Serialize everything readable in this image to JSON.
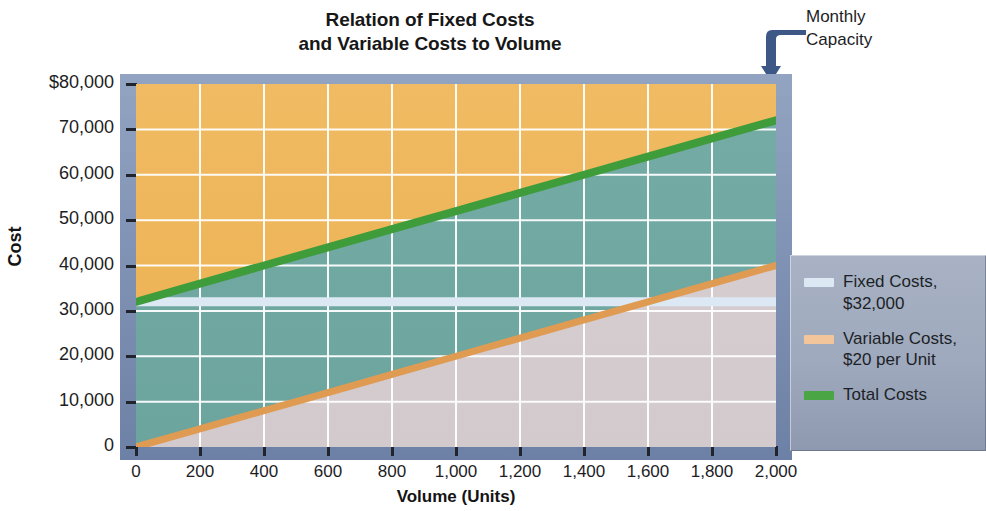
{
  "title": {
    "line1": "Relation of Fixed Costs",
    "line2": "and Variable Costs to Volume"
  },
  "annotation": {
    "name": "monthly-capacity",
    "line1": "Monthly",
    "line2": "Capacity",
    "icon": "elbow-arrow-down-icon",
    "at_volume": 2000
  },
  "axes": {
    "y_title": "Cost",
    "x_title": "Volume (Units)",
    "y_ticks": [
      "$80,000",
      "70,000",
      "60,000",
      "50,000",
      "40,000",
      "30,000",
      "20,000",
      "10,000",
      "0"
    ],
    "y_values": [
      80000,
      70000,
      60000,
      50000,
      40000,
      30000,
      20000,
      10000,
      0
    ],
    "x_ticks": [
      "0",
      "200",
      "400",
      "600",
      "800",
      "1,000",
      "1,200",
      "1,400",
      "1,600",
      "1,800",
      "2,000"
    ],
    "x_values": [
      0,
      200,
      400,
      600,
      800,
      1000,
      1200,
      1400,
      1600,
      1800,
      2000
    ]
  },
  "legend": {
    "items": [
      {
        "swatch": "#dce9f4",
        "label_line1": "Fixed Costs,",
        "label_line2": "$32,000",
        "name": "legend-fixed-costs"
      },
      {
        "swatch": "#f2c69a",
        "label_line1": "Variable Costs,",
        "label_line2": "$20 per Unit",
        "name": "legend-variable-costs"
      },
      {
        "swatch": "#4aa544",
        "label_line1": "Total Costs",
        "label_line2": "",
        "name": "legend-total-costs"
      }
    ]
  },
  "colors": {
    "band_above_total": "#eeb košice",
    "band_above_total_fill": "#efb75a",
    "band_middle_fill": "#6fa8a2",
    "band_below_variable_fill": "#d6cdd0",
    "fixed_line": "#dce9f4",
    "variable_line": "#e09b53",
    "total_line": "#3f9c3a",
    "grid": "#ffffff",
    "frame": "#7e91b4",
    "arrow": "#2d4a7c"
  },
  "chart_data": {
    "type": "line",
    "title": "Relation of Fixed Costs and Variable Costs to Volume",
    "xlabel": "Volume (Units)",
    "ylabel": "Cost",
    "xlim": [
      0,
      2000
    ],
    "ylim": [
      0,
      80000
    ],
    "grid": true,
    "legend_position": "right",
    "x": [
      0,
      200,
      400,
      600,
      800,
      1000,
      1200,
      1400,
      1600,
      1800,
      2000
    ],
    "series": [
      {
        "name": "Fixed Costs, $32,000",
        "color": "#dce9f4",
        "values": [
          32000,
          32000,
          32000,
          32000,
          32000,
          32000,
          32000,
          32000,
          32000,
          32000,
          32000
        ]
      },
      {
        "name": "Variable Costs, $20 per Unit",
        "color": "#e09b53",
        "values": [
          0,
          4000,
          8000,
          12000,
          16000,
          20000,
          24000,
          28000,
          32000,
          36000,
          40000
        ]
      },
      {
        "name": "Total Costs",
        "color": "#3f9c3a",
        "values": [
          32000,
          36000,
          40000,
          44000,
          48000,
          52000,
          56000,
          60000,
          64000,
          68000,
          72000
        ]
      }
    ],
    "annotations": [
      {
        "text": "Monthly Capacity",
        "x": 2000,
        "y": 80000
      }
    ]
  }
}
